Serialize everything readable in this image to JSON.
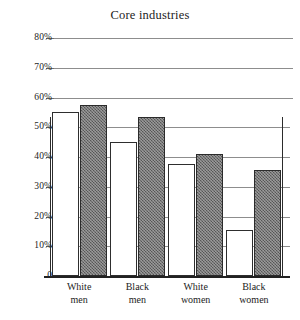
{
  "chart_data": {
    "type": "bar",
    "title": "Core industries",
    "xlabel": "",
    "ylabel": "",
    "ylim": [
      0,
      80
    ],
    "ytick_labels": [
      "80%",
      "70%",
      "60%",
      "50%",
      "40%",
      "30%",
      "20%",
      "10%",
      "0"
    ],
    "ytick_values": [
      80,
      70,
      60,
      50,
      40,
      30,
      20,
      10,
      0
    ],
    "grid": true,
    "legend": "none",
    "categories": [
      "White men",
      "Black men",
      "White women",
      "Black women"
    ],
    "category_lines": [
      [
        "White",
        "men"
      ],
      [
        "Black",
        "men"
      ],
      [
        "White",
        "women"
      ],
      [
        "Black",
        "women"
      ]
    ],
    "series": [
      {
        "name": "open",
        "style": "unfilled-outline",
        "values": [
          55,
          45,
          37.5,
          15.5
        ]
      },
      {
        "name": "shaded",
        "style": "gray-stippled",
        "values": [
          57.5,
          53.5,
          41,
          35.5
        ]
      }
    ],
    "colors": {
      "open_bar_fill": "#ffffff",
      "open_bar_edge": "#2e2e2e",
      "shaded_bar_fill": "#6e6e6e",
      "shaded_bar_edge": "#2b2b2b",
      "gridline": "#8d8d8d",
      "axis": "#222222",
      "text": "#1c1c1c",
      "background": "#ffffff"
    }
  }
}
